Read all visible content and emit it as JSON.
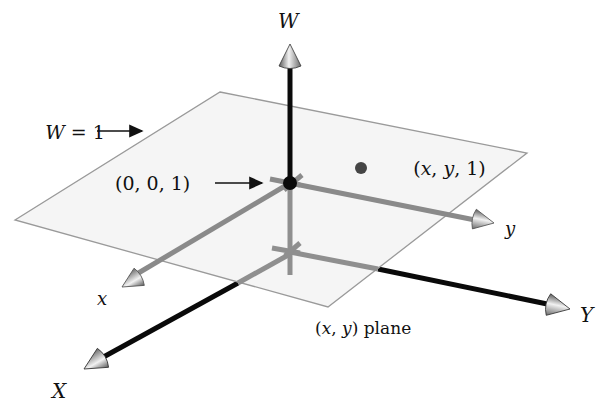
{
  "diagram": {
    "colors": {
      "background": "#ffffff",
      "axis_dark": "#0a0a0a",
      "axis_gray": "#8a8a8a",
      "plane_fill": "#f4f4f4",
      "plane_edge": "#9a9a9a",
      "point": "#444444",
      "text": "#111111"
    },
    "labels": {
      "W_axis": "W",
      "X_axis": "X",
      "Y_axis": "Y",
      "x_axis": "x",
      "y_axis": "y",
      "plane_eq_var": "W",
      "plane_eq_rest": " = 1",
      "origin_point": "(0, 0, 1)",
      "point_open": "(",
      "point_x": "x",
      "point_sep1": ", ",
      "point_y": "y",
      "point_rest": ", 1)",
      "xy_plane_open": "(",
      "xy_plane_x": "x",
      "xy_plane_sep": ", ",
      "xy_plane_y": "y",
      "xy_plane_rest": ") plane"
    }
  }
}
